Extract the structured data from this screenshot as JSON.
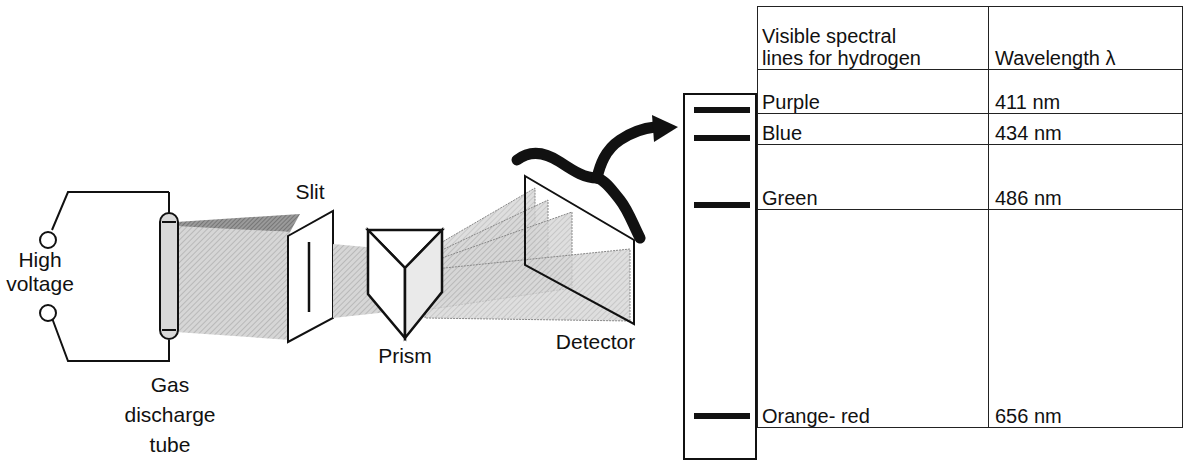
{
  "diagram": {
    "labels": {
      "high_voltage_line1": "High",
      "high_voltage_line2": "voltage",
      "tube_line1": "Gas",
      "tube_line2": "discharge",
      "tube_line3": "tube",
      "slit": "Slit",
      "prism": "Prism",
      "detector": "Detector"
    },
    "components": [
      "High voltage source",
      "Gas discharge tube",
      "Slit",
      "Prism",
      "Detector"
    ],
    "colors": {
      "line": "#111111",
      "beam": "#c8c8c8",
      "beam_dark": "#8a8a8a",
      "background": "#ffffff"
    }
  },
  "table": {
    "headers": {
      "col1_line1": "Visible spectral",
      "col1_line2": "lines for hydrogen",
      "col2": "Wavelength λ"
    },
    "rows": [
      {
        "color": "Purple",
        "wavelength": "411 nm"
      },
      {
        "color": "Blue",
        "wavelength": "434 nm"
      },
      {
        "color": "Green",
        "wavelength": "486 nm"
      },
      {
        "color": "Orange- red",
        "wavelength": "656 nm"
      }
    ]
  }
}
